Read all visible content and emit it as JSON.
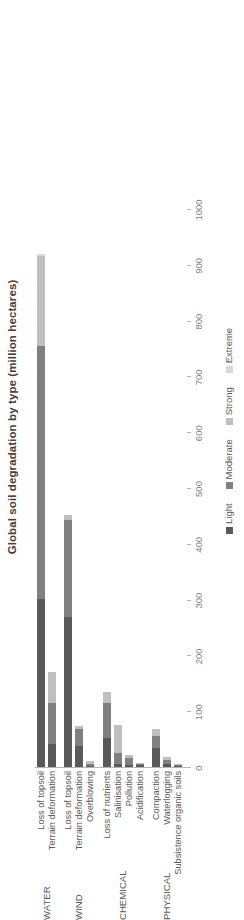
{
  "chart_data": {
    "type": "bar",
    "subtype": "stacked-horizontal",
    "title": "Global soil degradation by type (million hectares)",
    "xlabel": "",
    "ylabel": "",
    "xlim": [
      0,
      1000
    ],
    "tick_labels": [
      "0",
      "100",
      "200",
      "300",
      "400",
      "500",
      "600",
      "700",
      "800",
      "900",
      "1000"
    ],
    "tick_values": [
      0,
      100,
      200,
      300,
      400,
      500,
      600,
      700,
      800,
      900,
      1000
    ],
    "grid": false,
    "legend_position": "bottom",
    "legend": [
      {
        "label": "Light",
        "color": "#595959"
      },
      {
        "label": "Moderate",
        "color": "#808080"
      },
      {
        "label": "Strong",
        "color": "#bfbfbf"
      },
      {
        "label": "Extreme",
        "color": "#d9d9d9"
      }
    ],
    "series": [
      {
        "name": "Light",
        "values": [
          301,
          42,
          269,
          38,
          1,
          52,
          5,
          4,
          3,
          34,
          6,
          2
        ]
      },
      {
        "name": "Moderate",
        "values": [
          454,
          72,
          173,
          30,
          5,
          63,
          20,
          13,
          2,
          22,
          6,
          2
        ]
      },
      {
        "name": "Strong",
        "values": [
          161,
          56,
          9,
          6,
          4,
          19,
          51,
          4,
          1,
          12,
          6,
          1
        ]
      },
      {
        "name": "Extreme",
        "values": [
          4,
          0,
          0,
          0,
          0,
          0,
          0,
          0,
          0,
          0,
          0,
          0
        ]
      }
    ],
    "groups": [
      {
        "label": "WATER",
        "categories": [
          "Loss of topsoil",
          "Terrain deformation"
        ]
      },
      {
        "label": "WIND",
        "categories": [
          "Loss of topsoil",
          "Terrain deformation",
          "Overblowing"
        ]
      },
      {
        "label": "CHEMICAL",
        "categories": [
          "Loss of nutrients",
          "Salinisation",
          "Pollution",
          "Acidification"
        ]
      },
      {
        "label": "PHYSICAL",
        "categories": [
          "Compaction",
          "Waterlogging",
          "Subsistence organic soils"
        ]
      }
    ],
    "categories": [
      "Loss of topsoil",
      "Terrain deformation",
      "Loss of topsoil",
      "Terrain deformation",
      "Overblowing",
      "Loss of nutrients",
      "Salinisation",
      "Pollution",
      "Acidification",
      "Compaction",
      "Waterlogging",
      "Subsistence organic soils"
    ],
    "totals": [
      920,
      170,
      451,
      74,
      10,
      134,
      76,
      21,
      6,
      68,
      18,
      5
    ]
  }
}
